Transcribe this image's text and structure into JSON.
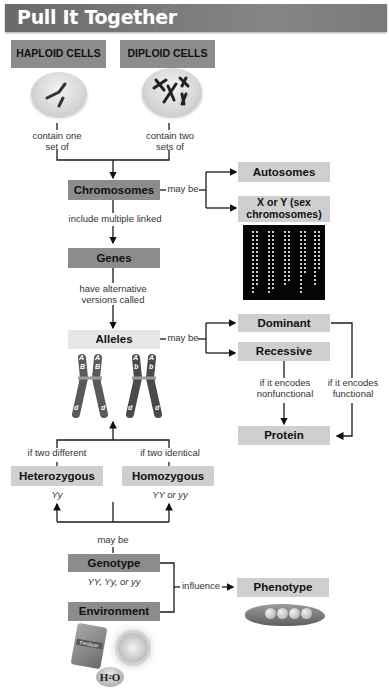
{
  "header": {
    "title": "Pull It Together"
  },
  "cells": {
    "haploid": {
      "label": "HAPLOID CELLS",
      "relation": "contain one set of"
    },
    "diploid": {
      "label": "DIPLOID CELLS",
      "relation": "contain two sets of"
    }
  },
  "chromosomes": {
    "label": "Chromosomes",
    "may_be": "may be",
    "types": [
      "Autosomes",
      "X or Y (sex chromosomes)"
    ],
    "include_text": "include multiple linked"
  },
  "genes": {
    "label": "Genes",
    "relation": "have alternative versions called"
  },
  "alleles": {
    "label": "Alleles",
    "may_be": "may be",
    "types": [
      "Dominant",
      "Recessive"
    ],
    "left_chromosome_tags": [
      "A",
      "A",
      "B",
      "B",
      "d",
      "d"
    ],
    "right_chromosome_tags": [
      "A",
      "A",
      "b",
      "b",
      "d",
      "d"
    ]
  },
  "protein": {
    "label": "Protein",
    "recessive_relation": "if it encodes nonfunctional",
    "dominant_relation": "if it encodes functional"
  },
  "zygosity": {
    "heterozygous": {
      "label": "Heterozygous",
      "condition": "if two different",
      "example": "Yy"
    },
    "homozygous": {
      "label": "Homozygous",
      "condition": "if two identical",
      "example": "YY or yy"
    },
    "may_be": "may be"
  },
  "genotype": {
    "label": "Genotype",
    "examples": "YY, Yy, or yy"
  },
  "environment": {
    "label": "Environment",
    "fertilizer_label": "Fertilizer",
    "water_label": "H",
    "water_sub": "2",
    "water_end": "O"
  },
  "phenotype": {
    "label": "Phenotype",
    "relation": "influence"
  }
}
